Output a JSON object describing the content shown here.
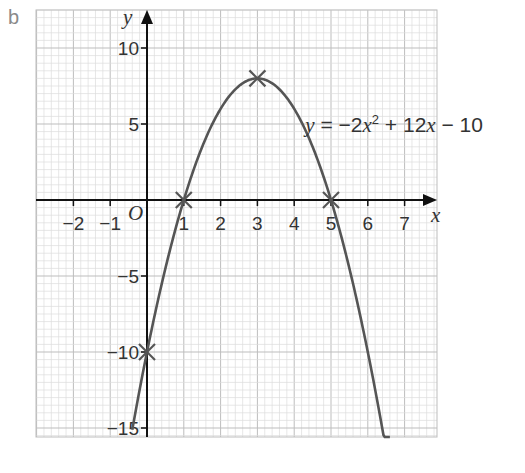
{
  "part_label": "b",
  "chart_data": {
    "type": "line",
    "title": "",
    "xlabel": "x",
    "ylabel": "y",
    "origin_label": "O",
    "xlim": [
      -3,
      7.5
    ],
    "ylim": [
      -18,
      12.5
    ],
    "grid": true,
    "x_ticks": [
      -2,
      -1,
      1,
      2,
      3,
      4,
      5,
      6,
      7
    ],
    "x_tick_labels": [
      "−2",
      "−1",
      "1",
      "2",
      "3",
      "4",
      "5",
      "6",
      "7"
    ],
    "y_ticks": [
      10,
      5,
      -5,
      -10,
      -15
    ],
    "y_tick_labels": [
      "10",
      "5",
      "−5",
      "−10",
      "−15"
    ],
    "series": [
      {
        "name": "y = −2x² + 12x − 10",
        "equation": {
          "a": -2,
          "b": 12,
          "c": -10
        },
        "color": "#555555",
        "x_range": [
          -0.4,
          6.6
        ]
      }
    ],
    "marked_points": [
      {
        "x": 1,
        "y": 0
      },
      {
        "x": 5,
        "y": 0
      },
      {
        "x": 3,
        "y": 8
      },
      {
        "x": 0,
        "y": -10
      }
    ],
    "annotation": {
      "parts": [
        "y",
        " = −2",
        "x",
        "2",
        " + 12",
        "x",
        " − 10"
      ],
      "x": 4.3,
      "y": 6
    }
  },
  "colors": {
    "grid_minor": "#dcdcdc",
    "grid_major": "#bdbdbd",
    "axis": "#111111",
    "curve": "#555555"
  }
}
